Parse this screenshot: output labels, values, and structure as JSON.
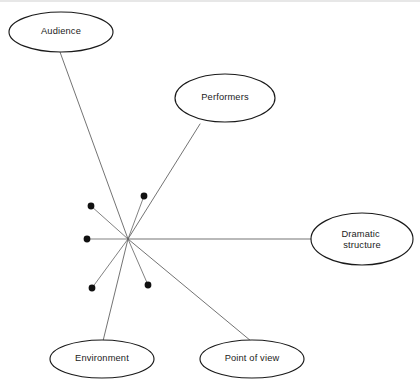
{
  "diagram": {
    "canvas": {
      "width": 420,
      "height": 388,
      "background": "#ffffff"
    },
    "style": {
      "node_stroke_color": "#1a1a1a",
      "node_fill_color": "#ffffff",
      "line_color": "#5a5a5a",
      "dot_color": "#111111",
      "label_color": "#1b1b1b",
      "frame_color": "#cfcfcf"
    },
    "hub": {
      "label": "",
      "x": 128,
      "y": 239
    },
    "nodes": [
      {
        "id": "audience",
        "label": "Audience",
        "label_lines": [
          "Audience"
        ],
        "cx": 61,
        "cy": 32,
        "rx": 52,
        "ry": 20
      },
      {
        "id": "performers",
        "label": "Performers",
        "label_lines": [
          "Performers"
        ],
        "cx": 225,
        "cy": 98,
        "rx": 50,
        "ry": 24
      },
      {
        "id": "dramatic-structure",
        "label": "Dramatic structure",
        "label_lines": [
          "Dramatic",
          "structure"
        ],
        "cx": 362,
        "cy": 239,
        "rx": 51,
        "ry": 26
      },
      {
        "id": "environment",
        "label": "Environment",
        "label_lines": [
          "Environment"
        ],
        "cx": 102,
        "cy": 359,
        "rx": 52,
        "ry": 19
      },
      {
        "id": "point-of-view",
        "label": "Point of view",
        "label_lines": [
          "Point of view"
        ],
        "cx": 252,
        "cy": 359,
        "rx": 52,
        "ry": 19
      }
    ],
    "spokes": [
      {
        "id": "hub-to-audience",
        "from": "hub",
        "to": "audience",
        "x1": 128,
        "y1": 239,
        "x2": 60,
        "y2": 52
      },
      {
        "id": "hub-to-performers",
        "from": "hub",
        "to": "performers",
        "x1": 128,
        "y1": 239,
        "x2": 200,
        "y2": 124
      },
      {
        "id": "hub-to-dramatic-structure",
        "from": "hub",
        "to": "dramatic-structure",
        "x1": 128,
        "y1": 239,
        "x2": 311,
        "y2": 239
      },
      {
        "id": "hub-to-environment",
        "from": "hub",
        "to": "environment",
        "x1": 128,
        "y1": 239,
        "x2": 103,
        "y2": 341
      },
      {
        "id": "hub-to-point-of-view",
        "from": "hub",
        "to": "point-of-view",
        "x1": 128,
        "y1": 239,
        "x2": 251,
        "y2": 341
      }
    ],
    "stubs": [
      {
        "id": "stub-upper-left",
        "dot_x": 91,
        "dot_y": 206,
        "dot_r": 3.4
      },
      {
        "id": "stub-upper-right",
        "dot_x": 144,
        "dot_y": 196,
        "dot_r": 3.4
      },
      {
        "id": "stub-left",
        "dot_x": 87,
        "dot_y": 239,
        "dot_r": 3.4
      },
      {
        "id": "stub-lower-left",
        "dot_x": 92,
        "dot_y": 288,
        "dot_r": 3.4
      },
      {
        "id": "stub-lower-right",
        "dot_x": 148,
        "dot_y": 285,
        "dot_r": 3.4
      }
    ],
    "frame": {
      "top_line": {
        "x1": 0,
        "y1": 1,
        "x2": 420,
        "y2": 1
      }
    }
  }
}
